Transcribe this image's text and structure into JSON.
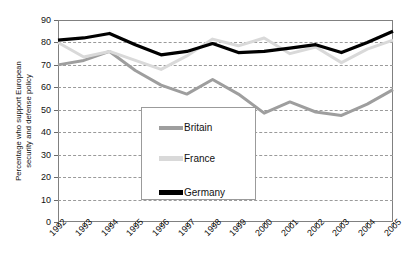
{
  "chart_data": {
    "type": "line",
    "title": "",
    "xlabel": "",
    "ylabel": "Percentage who support European security and defense policy",
    "ylabel_line1": "Percentage who support European",
    "ylabel_line2": "security and defense policy",
    "ylim": [
      0,
      90
    ],
    "ytick_step": 10,
    "yticks": [
      0,
      10,
      20,
      30,
      40,
      50,
      60,
      70,
      80,
      90
    ],
    "grid": true,
    "grid_style": "dashed-horizontal",
    "legend_position": "center-lower-inside",
    "categories": [
      "1992",
      "1993",
      "1994",
      "1995",
      "1996",
      "1997",
      "1998",
      "1999",
      "2000",
      "2001",
      "2002",
      "2003",
      "2004",
      "2005"
    ],
    "series": [
      {
        "name": "Britain",
        "color": "#9e9e9e",
        "values": [
          70,
          72,
          76,
          67.5,
          61,
          57,
          63.5,
          57,
          48.5,
          53.5,
          49,
          47.5,
          52.5,
          59
        ]
      },
      {
        "name": "France",
        "color": "#d9d9d9",
        "values": [
          80,
          73.5,
          76,
          72,
          68,
          74,
          81.5,
          78.5,
          82,
          75,
          78,
          71,
          77,
          81
        ]
      },
      {
        "name": "Germany",
        "color": "#000000",
        "values": [
          81,
          82,
          84,
          79,
          74.5,
          76,
          79.5,
          75.5,
          76,
          77.5,
          79,
          75.5,
          80,
          85
        ]
      }
    ]
  },
  "legend": {
    "items": [
      {
        "label": "Britain",
        "color": "#9e9e9e"
      },
      {
        "label": "France",
        "color": "#d9d9d9"
      },
      {
        "label": "Germany",
        "color": "#000000"
      }
    ]
  },
  "axis": {
    "y_title_line1": "Percentage who support European",
    "y_title_line2": "security and defense policy"
  },
  "clipped_title": ""
}
